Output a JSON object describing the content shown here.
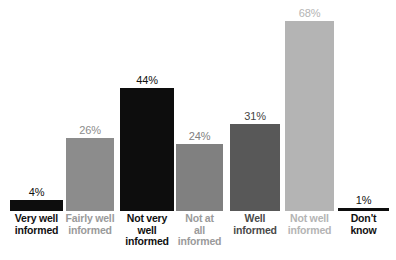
{
  "chart_data": {
    "type": "bar",
    "title": "",
    "subtitle": "",
    "xlabel": "",
    "ylabel": "",
    "ylim": [
      0,
      75
    ],
    "grid": false,
    "legend": "none",
    "categories": [
      "Very well informed",
      "Fairly well informed",
      "Not very well informed",
      "Not at all informed",
      "Well informed",
      "Not well informed",
      "Don't know"
    ],
    "values": [
      4,
      26,
      44,
      24,
      31,
      68,
      1
    ],
    "value_labels": [
      "4%",
      "26%",
      "44%",
      "24%",
      "31%",
      "68%",
      "1%"
    ],
    "series": [
      {
        "name": "Share of respondents",
        "values": [
          4,
          26,
          44,
          24,
          31,
          68,
          1
        ]
      }
    ],
    "bar_colors": [
      "#0d0d0d",
      "#8c8c8c",
      "#0d0d0d",
      "#808080",
      "#585858",
      "#b4b4b4",
      "#0d0d0d"
    ],
    "label_colors": [
      "#111111",
      "#8c8c8c",
      "#111111",
      "#808080",
      "#444444",
      "#b4b4b4",
      "#111111"
    ],
    "category_label_colors": [
      "#111111",
      "#9a9a9a",
      "#111111",
      "#9a9a9a",
      "#4a4a4a",
      "#b4b4b4",
      "#111111"
    ]
  },
  "bars": [
    {
      "category": "Very well informed",
      "category_lines": [
        "Very well",
        "informed"
      ],
      "value": 4,
      "value_label": "4%",
      "bar_color": "#0d0d0d",
      "value_label_color": "#111111",
      "category_color": "#111111"
    },
    {
      "category": "Fairly well informed",
      "category_lines": [
        "Fairly well",
        "informed"
      ],
      "value": 26,
      "value_label": "26%",
      "bar_color": "#8c8c8c",
      "value_label_color": "#8c8c8c",
      "category_color": "#9a9a9a"
    },
    {
      "category": "Not very well informed",
      "category_lines": [
        "Not very",
        "well",
        "informed"
      ],
      "value": 44,
      "value_label": "44%",
      "bar_color": "#0d0d0d",
      "value_label_color": "#111111",
      "category_color": "#111111"
    },
    {
      "category": "Not at all informed",
      "category_lines": [
        "Not at",
        "all",
        "informed"
      ],
      "value": 24,
      "value_label": "24%",
      "bar_color": "#808080",
      "value_label_color": "#808080",
      "category_color": "#9a9a9a"
    },
    {
      "category": "Well informed",
      "category_lines": [
        "Well",
        "informed"
      ],
      "value": 31,
      "value_label": "31%",
      "bar_color": "#585858",
      "value_label_color": "#444444",
      "category_color": "#4a4a4a"
    },
    {
      "category": "Not well informed",
      "category_lines": [
        "Not well",
        "informed"
      ],
      "value": 68,
      "value_label": "68%",
      "bar_color": "#b4b4b4",
      "value_label_color": "#b4b4b4",
      "category_color": "#b4b4b4"
    },
    {
      "category": "Don't know",
      "category_lines": [
        "Don't",
        "know"
      ],
      "value": 1,
      "value_label": "1%",
      "bar_color": "#0d0d0d",
      "value_label_color": "#111111",
      "category_color": "#111111"
    }
  ],
  "layout": {
    "baseline_y": 211,
    "px_per_percent": 2.8,
    "bar_geometry": [
      {
        "left": 10,
        "width": 53
      },
      {
        "left": 66,
        "width": 48
      },
      {
        "left": 120,
        "width": 54
      },
      {
        "left": 176,
        "width": 47
      },
      {
        "left": 230,
        "width": 50
      },
      {
        "left": 285,
        "width": 49
      },
      {
        "left": 338,
        "width": 51
      }
    ]
  }
}
